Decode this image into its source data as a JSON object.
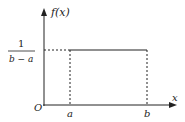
{
  "diagram": {
    "y_axis_label": "f(x)",
    "x_axis_label": "x",
    "origin_label": "O",
    "x_ticks": [
      "a",
      "b"
    ],
    "density_label": {
      "numerator": "1",
      "denominator": "b − a"
    },
    "colors": {
      "stroke": "#222222",
      "background": "#ffffff"
    }
  }
}
